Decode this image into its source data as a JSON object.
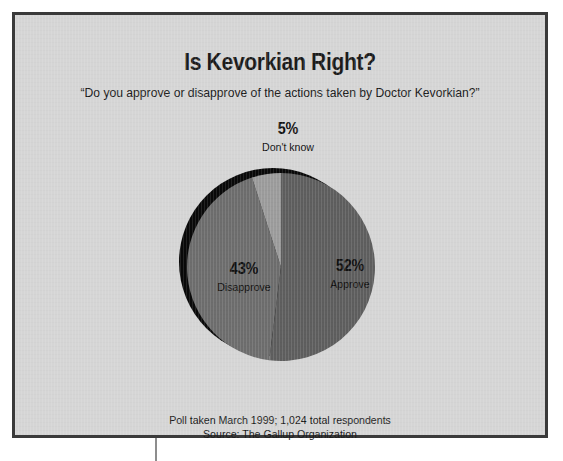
{
  "panel": {
    "background_color": "#d5d5d5",
    "border_color": "#3a3a3a"
  },
  "header": {
    "title": "Is Kevorkian Right?",
    "subtitle": "“Do you approve or disapprove of the actions taken by Doctor Kevorkian?”"
  },
  "footer": {
    "line1": "Poll taken March 1999; 1,024 total respondents",
    "line2": "Source: The Gallup Organization"
  },
  "labels": {
    "approve": {
      "pct": "52%",
      "name": "Approve"
    },
    "disapprove": {
      "pct": "43%",
      "name": "Disapprove"
    },
    "dont_know": {
      "pct": "5%",
      "name": "Don't know"
    }
  },
  "chart_data": {
    "type": "pie",
    "title": "Is Kevorkian Right?",
    "subtitle": "“Do you approve or disapprove of the actions taken by Doctor Kevorkian?”",
    "categories": [
      "Approve",
      "Disapprove",
      "Don't know"
    ],
    "values": [
      52,
      43,
      5
    ],
    "value_labels": [
      "52%",
      "43%",
      "5%"
    ],
    "unit": "percent",
    "total": 100,
    "colors": [
      "#5e5e5e",
      "#6d6d6d",
      "#9b9b9b"
    ],
    "shadow_color": "#090909",
    "legend": "none",
    "labels_inside": true,
    "start_angle_deg": 0,
    "direction": "clockwise",
    "source": "Source: The Gallup Organization",
    "note": "Poll taken March 1999; 1,024 total respondents",
    "sample_size": 1024,
    "poll_date": "March 1999"
  }
}
